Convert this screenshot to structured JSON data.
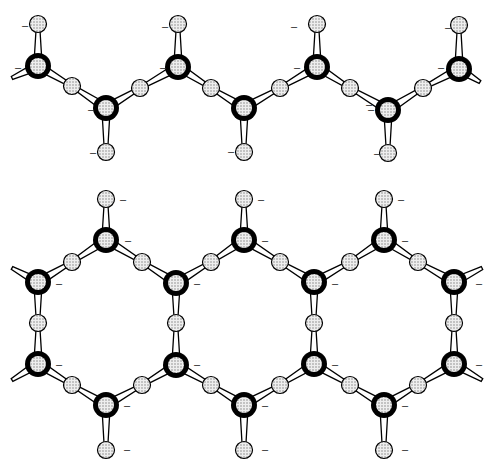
{
  "diagram": {
    "colors": {
      "background": "#ffffff",
      "stroke": "#000000",
      "atom_fill": "#d9d9d9",
      "cation_ring": "#000000"
    },
    "charge_label": "–",
    "chain": {
      "cations": [
        [
          38,
          66
        ],
        [
          106,
          108
        ],
        [
          178,
          67
        ],
        [
          244,
          108
        ],
        [
          317,
          67
        ],
        [
          388,
          110
        ],
        [
          459,
          69
        ]
      ],
      "apical_oxygens": [
        [
          38,
          24,
          "up"
        ],
        [
          106,
          152,
          "down"
        ],
        [
          178,
          24,
          "up"
        ],
        [
          244,
          152,
          "down"
        ],
        [
          317,
          24,
          "up"
        ],
        [
          388,
          153,
          "down"
        ],
        [
          459,
          25,
          "up"
        ]
      ],
      "bridging_oxygens": [
        [
          72,
          86
        ],
        [
          140,
          88
        ],
        [
          211,
          88
        ],
        [
          280,
          88
        ],
        [
          350,
          88
        ],
        [
          423,
          88
        ]
      ],
      "labels": [
        [
          22,
          25
        ],
        [
          15,
          67
        ],
        [
          88,
          109
        ],
        [
          90,
          152
        ],
        [
          162,
          26
        ],
        [
          160,
          67
        ],
        [
          228,
          151
        ],
        [
          291,
          26
        ],
        [
          294,
          67
        ],
        [
          368,
          109
        ],
        [
          374,
          153
        ],
        [
          445,
          27
        ],
        [
          438,
          67
        ],
        [
          366,
          104
        ]
      ],
      "edge_stubs": [
        [
          38,
          66,
          12,
          78
        ],
        [
          459,
          69,
          480,
          82
        ]
      ]
    },
    "ladder": {
      "cations": [
        [
          106,
          240
        ],
        [
          244,
          240
        ],
        [
          384,
          240
        ],
        [
          38,
          282
        ],
        [
          176,
          283
        ],
        [
          314,
          282
        ],
        [
          454,
          282
        ],
        [
          38,
          364
        ],
        [
          176,
          365
        ],
        [
          314,
          364
        ],
        [
          454,
          364
        ],
        [
          106,
          405
        ],
        [
          244,
          405
        ],
        [
          384,
          405
        ]
      ],
      "apical_oxygens": [
        [
          106,
          199
        ],
        [
          244,
          199
        ],
        [
          384,
          199
        ],
        [
          106,
          450
        ],
        [
          244,
          450
        ],
        [
          384,
          450
        ]
      ],
      "bridging_oxygens": [
        [
          72,
          262
        ],
        [
          142,
          262
        ],
        [
          211,
          262
        ],
        [
          280,
          262
        ],
        [
          350,
          262
        ],
        [
          418,
          262
        ],
        [
          38,
          323
        ],
        [
          176,
          323
        ],
        [
          314,
          323
        ],
        [
          454,
          323
        ],
        [
          72,
          385
        ],
        [
          142,
          385
        ],
        [
          211,
          385
        ],
        [
          280,
          385
        ],
        [
          350,
          385
        ],
        [
          418,
          385
        ]
      ],
      "labels": [
        [
          120,
          199
        ],
        [
          125,
          240
        ],
        [
          56,
          283
        ],
        [
          194,
          283
        ],
        [
          258,
          199
        ],
        [
          262,
          240
        ],
        [
          332,
          283
        ],
        [
          398,
          199
        ],
        [
          402,
          240
        ],
        [
          476,
          283
        ],
        [
          56,
          364
        ],
        [
          194,
          364
        ],
        [
          332,
          364
        ],
        [
          476,
          364
        ],
        [
          124,
          405
        ],
        [
          124,
          449
        ],
        [
          262,
          405
        ],
        [
          262,
          449
        ],
        [
          402,
          405
        ],
        [
          402,
          449
        ]
      ],
      "edge_stubs": [
        [
          38,
          282,
          12,
          268
        ],
        [
          454,
          282,
          482,
          268
        ],
        [
          38,
          364,
          12,
          380
        ],
        [
          454,
          364,
          482,
          380
        ]
      ]
    }
  }
}
